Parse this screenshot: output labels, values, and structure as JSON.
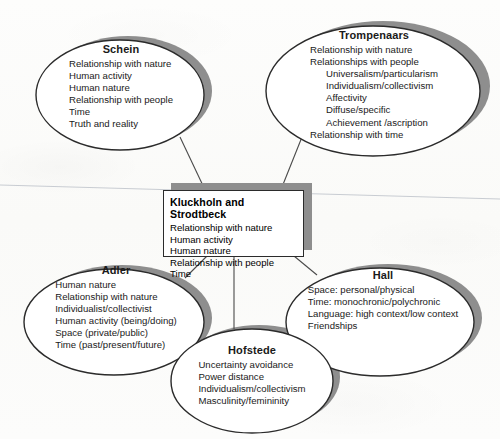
{
  "diagram": {
    "title_center": "Kluckholn and Strodtbeck",
    "colors": {
      "outline": "#2b2b2b",
      "shadow": "#8e8e8e",
      "fill": "#ffffff",
      "text": "#1a1a1a",
      "background": "#fbfbfa",
      "connector": "#4a4a4a"
    },
    "center": {
      "label": "Kluckholn and Strodtbeck",
      "items": [
        "Relationship with nature",
        "Human activity",
        "Human nature",
        "Relationship with people",
        "Time"
      ]
    },
    "nodes": [
      {
        "id": "schein",
        "label": "Schein",
        "items": [
          {
            "text": "Relationship with nature",
            "indent": 0
          },
          {
            "text": "Human activity",
            "indent": 0
          },
          {
            "text": "Human nature",
            "indent": 0
          },
          {
            "text": "Relationship with people",
            "indent": 0
          },
          {
            "text": "Time",
            "indent": 0
          },
          {
            "text": "Truth and reality",
            "indent": 0
          }
        ]
      },
      {
        "id": "trompenaars",
        "label": "Trompenaars",
        "items": [
          {
            "text": "Relationship with nature",
            "indent": 0
          },
          {
            "text": "Relationships with people",
            "indent": 0
          },
          {
            "text": "Universalism/particularism",
            "indent": 1
          },
          {
            "text": "Individualism/collectivism",
            "indent": 1
          },
          {
            "text": "Affectivity",
            "indent": 1
          },
          {
            "text": "Diffuse/specific",
            "indent": 1
          },
          {
            "text": "Achievement /ascription",
            "indent": 1
          },
          {
            "text": "Relationship with time",
            "indent": 0
          }
        ]
      },
      {
        "id": "adler",
        "label": "Adler",
        "items": [
          {
            "text": "Human nature",
            "indent": 0
          },
          {
            "text": "Relationship with nature",
            "indent": 0
          },
          {
            "text": "Individualist/collectivist",
            "indent": 0
          },
          {
            "text": "Human activity (being/doing)",
            "indent": 0
          },
          {
            "text": "Space (private/public)",
            "indent": 0
          },
          {
            "text": "Time (past/present/future)",
            "indent": 0
          }
        ]
      },
      {
        "id": "hall",
        "label": "Hall",
        "items": [
          {
            "text": "Space: personal/physical",
            "indent": 0
          },
          {
            "text": "Time: monochronic/polychronic",
            "indent": 0
          },
          {
            "text": "Language: high context/low context",
            "indent": 0
          },
          {
            "text": "Friendships",
            "indent": 0
          }
        ]
      },
      {
        "id": "hofstede",
        "label": "Hofstede",
        "items": [
          {
            "text": "Uncertainty avoidance",
            "indent": 0
          },
          {
            "text": "Power distance",
            "indent": 0
          },
          {
            "text": "Individualism/collectivism",
            "indent": 0
          },
          {
            "text": "Masculinity/femininity",
            "indent": 0
          }
        ]
      }
    ]
  }
}
